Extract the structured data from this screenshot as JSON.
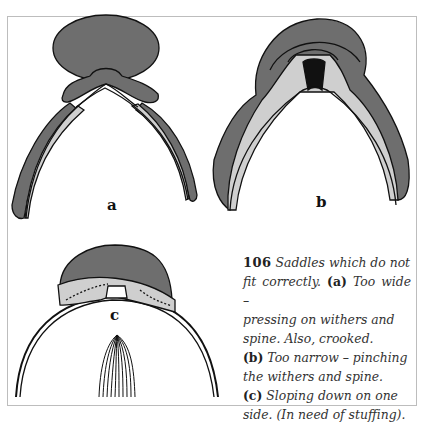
{
  "figure": {
    "number": "106",
    "labels": {
      "a": "a",
      "b": "b",
      "c": "c"
    },
    "caption": {
      "intro": "Saddles which do not fit correctly.",
      "items": [
        {
          "tag": "(a)",
          "text": "Too wide – pressing on withers and spine. Also, crooked."
        },
        {
          "tag": "(b)",
          "text": "Too narrow – pinching the withers and spine."
        },
        {
          "tag": "(c)",
          "text": "Sloping down on one side. (In need of stuffing)."
        }
      ],
      "lines": [
        {
          "num": "106",
          "it": " Saddles which do not"
        },
        {
          "it": "fit correctly. ",
          "tag": "(a)",
          "it2": " Too wide –"
        },
        {
          "it": "pressing on withers and"
        },
        {
          "it": "spine. Also, crooked."
        },
        {
          "tag": "(b)",
          "it": " Too narrow – pinching"
        },
        {
          "it": "the withers and spine."
        },
        {
          "tag": "(c)",
          "it": " Sloping down on one"
        },
        {
          "it": "side. (In need of stuffing)."
        }
      ]
    },
    "colors": {
      "saddle_dark": "#6e6e6e",
      "panel_light": "#cfcfcf",
      "outline": "#111111",
      "frame": "#bdbdbd"
    }
  }
}
